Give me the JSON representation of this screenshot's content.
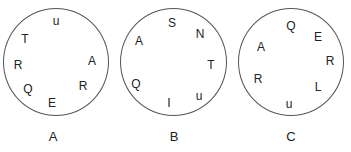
{
  "circles": [
    {
      "label": "A",
      "letters": [
        "u",
        "T",
        "R",
        "Q",
        "E",
        "R",
        "A"
      ]
    },
    {
      "label": "B",
      "letters": [
        "S",
        "N",
        "A",
        "T",
        "Q",
        "u",
        "I"
      ]
    },
    {
      "label": "C",
      "letters": [
        "Q",
        "E",
        "A",
        "R",
        "R",
        "L",
        "u"
      ]
    }
  ]
}
